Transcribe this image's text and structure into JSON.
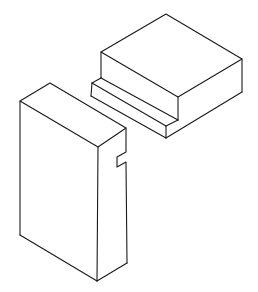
{
  "figure": {
    "title": "",
    "background_color": "#ffffff",
    "line_color": "#1a1a1a",
    "parts": [
      {
        "name": "upper-block-with-tongue",
        "label": ""
      },
      {
        "name": "lower-block-with-groove",
        "label": ""
      }
    ]
  }
}
